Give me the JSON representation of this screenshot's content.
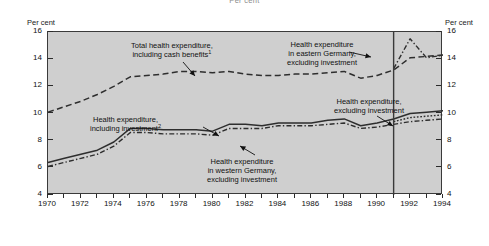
{
  "suptitle": "Per cent",
  "axis": {
    "y_title_left": "Per cent",
    "y_title_right": "Per cent",
    "y_ticks": [
      16,
      14,
      12,
      10,
      8,
      6,
      4
    ],
    "y_min": 4,
    "y_max": 16,
    "x_min": 1970,
    "x_max": 1994,
    "x_labels": [
      1970,
      1972,
      1974,
      1976,
      1978,
      1980,
      1982,
      1984,
      1986,
      1988,
      1990,
      1992,
      1994
    ]
  },
  "annotations": {
    "total_health": {
      "line1": "Total health expenditure,",
      "line2": "including cash benefits",
      "note": "1"
    },
    "eastern": {
      "line1": "Health expenditure",
      "line2": "in eastern Germany,",
      "line3": "excluding investment"
    },
    "including_investment": {
      "line1": "Health expenditure,",
      "line2": "including investment",
      "note": "2"
    },
    "western": {
      "line1": "Health expenditure",
      "line2": "in western Germany,",
      "line3": "excluding investment"
    },
    "excluding_investment": {
      "line1": "Health expenditure,",
      "line2": "excluding investment"
    }
  },
  "divider_year": 1991,
  "chart_data": {
    "type": "line",
    "title": "Per cent",
    "xlabel": "",
    "ylabel": "Per cent",
    "xlim": [
      1970,
      1994
    ],
    "ylim": [
      4,
      16
    ],
    "grid": false,
    "legend": "annotations-on-plot",
    "x": [
      1970,
      1971,
      1972,
      1973,
      1974,
      1975,
      1976,
      1977,
      1978,
      1979,
      1980,
      1981,
      1982,
      1983,
      1984,
      1985,
      1986,
      1987,
      1988,
      1989,
      1990,
      1991,
      1992,
      1993,
      1994
    ],
    "series": [
      {
        "name": "Total health expenditure, including cash benefits",
        "style": "dashed",
        "values": [
          10.1,
          10.5,
          10.9,
          11.4,
          12.0,
          12.7,
          12.8,
          12.9,
          13.1,
          13.1,
          13.0,
          13.1,
          12.9,
          12.8,
          12.8,
          12.9,
          12.9,
          13.0,
          13.1,
          12.6,
          12.8,
          13.2,
          14.1,
          14.2,
          14.3
        ]
      },
      {
        "name": "Health expenditure, including investment",
        "style": "solid",
        "values": [
          6.4,
          6.7,
          7.0,
          7.3,
          7.9,
          8.9,
          8.9,
          8.8,
          8.8,
          8.8,
          8.7,
          9.2,
          9.2,
          9.1,
          9.3,
          9.3,
          9.3,
          9.5,
          9.6,
          9.1,
          9.3,
          9.6,
          10.0,
          10.1,
          10.2
        ]
      },
      {
        "name": "Health expenditure, excluding investment",
        "style": "dotted",
        "values": [
          null,
          null,
          null,
          null,
          null,
          null,
          null,
          null,
          null,
          null,
          null,
          null,
          null,
          null,
          null,
          null,
          null,
          null,
          null,
          null,
          null,
          9.4,
          9.7,
          9.8,
          9.9
        ]
      },
      {
        "name": "Health expenditure in western Germany, excluding investment",
        "style": "dashdot",
        "values": [
          6.1,
          6.4,
          6.7,
          7.0,
          7.6,
          8.6,
          8.6,
          8.5,
          8.5,
          8.5,
          8.4,
          8.9,
          8.9,
          8.9,
          9.1,
          9.1,
          9.1,
          9.2,
          9.3,
          8.9,
          9.0,
          9.2,
          9.4,
          9.5,
          9.6
        ]
      },
      {
        "name": "Health expenditure in eastern Germany, excluding investment",
        "style": "dashdot",
        "values": [
          null,
          null,
          null,
          null,
          null,
          null,
          null,
          null,
          null,
          null,
          null,
          null,
          null,
          null,
          null,
          null,
          null,
          null,
          null,
          null,
          null,
          13.3,
          15.5,
          14.1,
          14.3
        ]
      }
    ]
  }
}
